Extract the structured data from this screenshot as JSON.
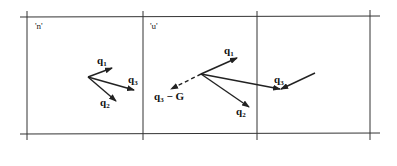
{
  "figure": {
    "type": "periodic-cell-vector-diagram",
    "cells": [
      {
        "label": "'n'"
      },
      {
        "label": "'u'"
      },
      {
        "label": ""
      }
    ],
    "cell_n_vectors": {
      "q1": {
        "base": "q",
        "sub": "1"
      },
      "q2": {
        "base": "q",
        "sub": "2"
      },
      "q3": {
        "base": "q",
        "sub": "3"
      }
    },
    "cell_u_vectors": {
      "q1": {
        "base": "q",
        "sub": "1"
      },
      "q2": {
        "base": "q",
        "sub": "2"
      },
      "q3_minus_G": {
        "base": "q",
        "sub": "3",
        "suffix": " − G"
      }
    },
    "cell_3_vector": {
      "q3": {
        "base": "q",
        "sub": "3"
      }
    },
    "colors": {
      "line": "#222222",
      "background": "#ffffff"
    }
  }
}
